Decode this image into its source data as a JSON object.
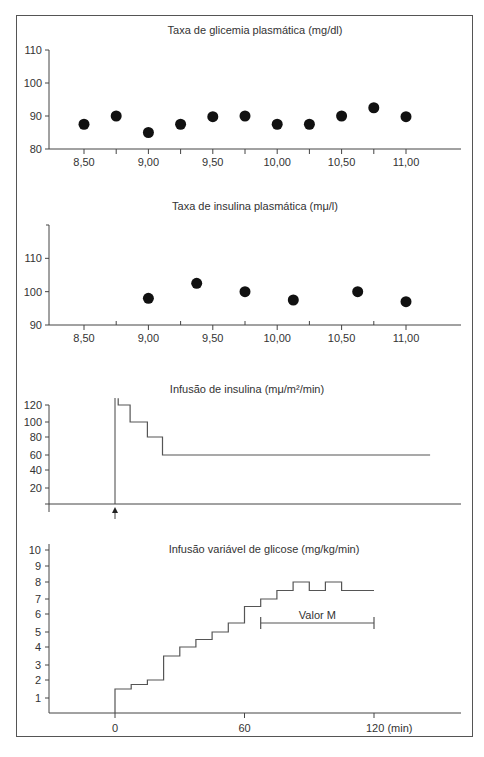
{
  "chart_data": [
    {
      "type": "scatter",
      "title": "Taxa de glicemia plasmática (mg/dl)",
      "xlabel": "",
      "ylabel": "",
      "x_ticks": [
        "8,50",
        "9,00",
        "9,50",
        "10,00",
        "10,50",
        "11,00"
      ],
      "x_tick_values": [
        8.5,
        9.0,
        9.5,
        10.0,
        10.5,
        11.0
      ],
      "x_minor_ticks": [
        8.75,
        9.25,
        9.75,
        10.25,
        10.75
      ],
      "xlim": [
        8.0,
        11.4
      ],
      "y_ticks": [
        "80",
        "90",
        "100",
        "110"
      ],
      "y_tick_values": [
        80,
        90,
        100,
        110
      ],
      "ylim": [
        80,
        110
      ],
      "grid": false,
      "x": [
        8.5,
        8.75,
        9.0,
        9.25,
        9.5,
        9.75,
        10.0,
        10.25,
        10.5,
        10.75,
        11.0
      ],
      "y": [
        87.5,
        90,
        85,
        87.5,
        89.8,
        90,
        87.5,
        87.5,
        90,
        92.5,
        89.8
      ]
    },
    {
      "type": "scatter",
      "title": "Taxa de insulina plasmática (mμ/l)",
      "xlabel": "",
      "ylabel": "",
      "x_ticks": [
        "8,50",
        "9,00",
        "9,50",
        "10,00",
        "10,50",
        "11,00"
      ],
      "x_tick_values": [
        8.5,
        9.0,
        9.5,
        10.0,
        10.5,
        11.0
      ],
      "x_minor_ticks": [
        8.75,
        9.25,
        9.75,
        10.25,
        10.75
      ],
      "xlim": [
        8.0,
        11.4
      ],
      "y_ticks": [
        "90",
        "100",
        "110"
      ],
      "y_tick_values": [
        90,
        100,
        110
      ],
      "ylim": [
        90,
        120
      ],
      "grid": false,
      "x": [
        9.0,
        9.375,
        9.75,
        10.125,
        10.625,
        11.0
      ],
      "y": [
        98,
        102.5,
        100,
        97.5,
        100,
        97
      ]
    },
    {
      "type": "line",
      "title": "Infusão de insulina (mμ/m²/min)",
      "xlabel": "",
      "ylabel": "",
      "y_ticks": [
        "20",
        "40",
        "60",
        "80",
        "100",
        "120"
      ],
      "y_tick_values": [
        20,
        40,
        60,
        80,
        100,
        120
      ],
      "ylim": [
        0,
        120
      ],
      "xlim": [
        -30,
        160
      ],
      "grid": false,
      "marker_arrow_at_x": 0,
      "step_x": [
        1.5,
        1.5,
        7,
        7,
        15,
        15,
        22,
        22,
        146
      ],
      "step_y": [
        128,
        120,
        120,
        100,
        100,
        80,
        80,
        60,
        60
      ],
      "series": [
        {
          "name": "Infusão de insulina",
          "x": [
            1.5,
            7,
            15,
            22,
            146
          ],
          "y": [
            120,
            100,
            80,
            60,
            60
          ]
        }
      ]
    },
    {
      "type": "line",
      "title": "Infusão variável de glicose (mg/kg/min)",
      "xlabel": "(min)",
      "ylabel": "",
      "x_ticks": [
        "0",
        "60",
        "120 (min)"
      ],
      "x_tick_values": [
        0,
        60,
        120
      ],
      "xlim": [
        -30,
        160
      ],
      "y_ticks": [
        "1",
        "2",
        "3",
        "4",
        "5",
        "6",
        "7",
        "8",
        "9",
        "10"
      ],
      "y_tick_values": [
        1,
        2,
        3,
        4,
        5,
        6,
        7,
        8,
        9,
        10
      ],
      "ylim": [
        0,
        10
      ],
      "grid": false,
      "series": [
        {
          "name": "Infusão variável de glicose",
          "step_starts": [
            0,
            7.5,
            15,
            22.5,
            30,
            37.5,
            45,
            52.5,
            60,
            67.5,
            75,
            82.5,
            90,
            97.5,
            105
          ],
          "values": [
            1.5,
            1.75,
            2,
            3.5,
            4,
            4.5,
            5,
            5.5,
            6.5,
            7,
            7.5,
            8,
            7.5,
            8,
            7.5
          ],
          "end_x": 120
        }
      ],
      "annotations": [
        {
          "text": "Valor M",
          "x_range": [
            67.5,
            120
          ],
          "y": 5.5
        }
      ]
    }
  ]
}
